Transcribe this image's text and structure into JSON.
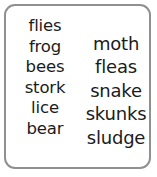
{
  "card": {
    "border_color": "#909090",
    "background_color": "#ffffff",
    "text_color": "#1b1b1b"
  },
  "columns": {
    "left": {
      "words": [
        "flies",
        "frog",
        "bees",
        "stork",
        "lice",
        "bear"
      ]
    },
    "right": {
      "words": [
        "moth",
        "fleas",
        "snake",
        "skunks",
        "sludge"
      ]
    }
  }
}
